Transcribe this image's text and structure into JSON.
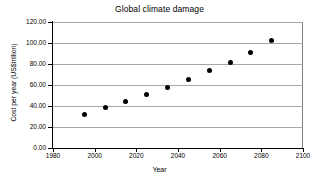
{
  "chart_data": {
    "type": "scatter",
    "title": "Global climate damage",
    "xlabel": "Year",
    "ylabel": "Cost per year (US$trillion)",
    "xlim": [
      1980,
      2100
    ],
    "ylim": [
      0,
      120
    ],
    "xticks": [
      1980,
      2000,
      2020,
      2040,
      2060,
      2080,
      2100
    ],
    "xtick_labels": [
      "1980",
      "2000",
      "2020",
      "2040",
      "2060",
      "2080",
      "2100"
    ],
    "yticks": [
      0,
      20,
      40,
      60,
      80,
      100,
      120
    ],
    "ytick_labels": [
      "0.00",
      "20.00",
      "40.00",
      "60.00",
      "80.00",
      "100.00",
      "120.00"
    ],
    "grid": "horizontal",
    "legend": "none",
    "marker_color": "#000000",
    "gridline_color": "#a6a6a6",
    "axis_color": "#000000",
    "plot_background": "#ffffff",
    "x": [
      1995,
      2005,
      2015,
      2025,
      2035,
      2045,
      2055,
      2065,
      2075,
      2085
    ],
    "values": [
      32.0,
      38.5,
      44.5,
      50.5,
      58.0,
      65.5,
      73.5,
      81.5,
      91.0,
      102.0
    ],
    "series": [
      {
        "name": "Global climate damage",
        "points": [
          {
            "year": 1995,
            "cost": 32.0
          },
          {
            "year": 2005,
            "cost": 38.5
          },
          {
            "year": 2015,
            "cost": 44.5
          },
          {
            "year": 2025,
            "cost": 50.5
          },
          {
            "year": 2035,
            "cost": 58.0
          },
          {
            "year": 2045,
            "cost": 65.5
          },
          {
            "year": 2055,
            "cost": 73.5
          },
          {
            "year": 2065,
            "cost": 81.5
          },
          {
            "year": 2075,
            "cost": 91.0
          },
          {
            "year": 2085,
            "cost": 102.0
          }
        ]
      }
    ]
  }
}
